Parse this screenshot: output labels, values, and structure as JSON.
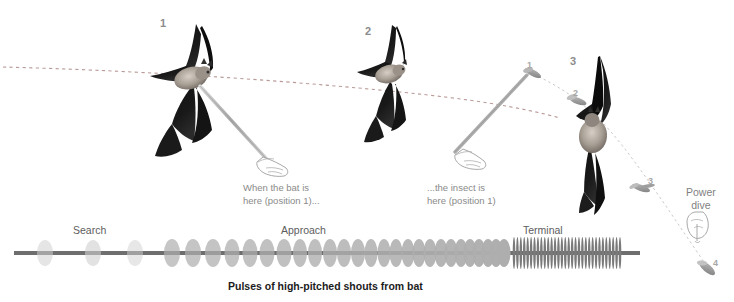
{
  "figure": {
    "caption": "Pulses of high-pitched shouts from bat",
    "bat_labels": [
      {
        "text": "1",
        "x": 160,
        "y": 18
      },
      {
        "text": "2",
        "x": 365,
        "y": 26
      },
      {
        "text": "3",
        "x": 570,
        "y": 56
      }
    ],
    "insect_labels": [
      {
        "text": "1",
        "x": 527,
        "y": 61
      },
      {
        "text": "2",
        "x": 573,
        "y": 89
      },
      {
        "text": "3",
        "x": 648,
        "y": 177
      },
      {
        "text": "4",
        "x": 713,
        "y": 259
      }
    ],
    "callouts": [
      {
        "line1": "When the bat is",
        "line2": "here (position 1)...",
        "x": 243,
        "y": 181
      },
      {
        "line1": "...the insect is",
        "line2": "here (position 1)",
        "x": 427,
        "y": 181
      }
    ],
    "phases": [
      {
        "label": "Search",
        "x": 73,
        "y": 225
      },
      {
        "label": "Approach",
        "x": 281,
        "y": 225
      },
      {
        "label": "Terminal",
        "x": 523,
        "y": 225
      }
    ],
    "power_dive": {
      "line1": "Power",
      "line2": "dive",
      "x": 690,
      "y": 186
    },
    "colors": {
      "pulse_bar": "#6e6e6e",
      "pulse_search": "#cfcfcf",
      "pulse_approach": "#aeaeae",
      "pulse_terminal": "#7a7a7a",
      "trajectory_dash": "#b89a98",
      "insect_path": "#c9c9c9",
      "pointer_rod": "#b4b4b4",
      "label_grey": "#8c8c8c",
      "caption_black": "#1c1c1c",
      "background": "#ffffff"
    }
  },
  "chart_data": {
    "type": "bar",
    "title": "Pulses of high-pitched shouts from bat",
    "xlabel": "",
    "ylabel": "",
    "categories": [
      "Search",
      "Approach",
      "Terminal"
    ],
    "series": [
      {
        "name": "Search",
        "pulse_x": [
          45,
          93,
          135
        ],
        "pulse_width": [
          16,
          16,
          16
        ],
        "pulse_height": [
          26,
          26,
          26
        ],
        "opacity": [
          0.55,
          0.6,
          0.5
        ]
      },
      {
        "name": "Approach",
        "pulse_x": [
          172,
          193,
          213,
          232,
          250,
          267,
          284,
          300,
          315,
          330,
          344,
          358,
          371,
          384,
          396,
          408,
          419,
          430,
          441,
          451,
          461,
          470,
          479,
          488,
          496,
          504
        ],
        "pulse_width": [
          16,
          16,
          16,
          15,
          15,
          15,
          15,
          14,
          14,
          14,
          14,
          14,
          13,
          13,
          13,
          13,
          13,
          13,
          13,
          13,
          13,
          13,
          13,
          13,
          13,
          13
        ],
        "pulse_height": [
          28,
          28,
          28,
          28,
          28,
          28,
          28,
          28,
          28,
          28,
          28,
          28,
          28,
          28,
          28,
          28,
          28,
          28,
          28,
          28,
          28,
          28,
          28,
          28,
          28,
          28
        ]
      },
      {
        "name": "Terminal",
        "count": 32,
        "start_x": 514,
        "end_x": 620,
        "pulse_width": 2.6,
        "pulse_height": 32
      }
    ],
    "axis_line": {
      "x1": 14,
      "x2": 640,
      "y": 253,
      "thickness": 4
    }
  }
}
